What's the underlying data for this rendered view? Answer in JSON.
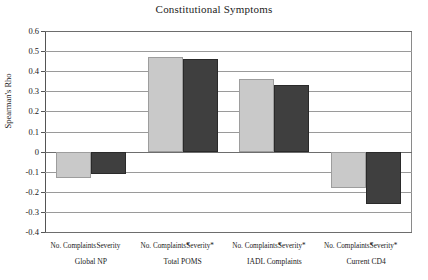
{
  "chart_data": {
    "type": "bar",
    "title": "Constitutional Symptoms",
    "xlabel": "",
    "ylabel": "Spearman's Rho",
    "ylim": [
      -0.4,
      0.6
    ],
    "yticks": [
      0.6,
      0.5,
      0.4,
      0.3,
      0.2,
      0.1,
      0,
      -0.1,
      -0.2,
      -0.3,
      -0.4
    ],
    "ytick_labels": [
      "0.6",
      "0.5",
      "0.4",
      "0.3",
      "0.2",
      "0.1",
      "0",
      "-0.1",
      "-0.2",
      "-0.3",
      "-0.4"
    ],
    "grid": true,
    "legend": "none",
    "groups": [
      {
        "name": "Global NP",
        "bars": [
          {
            "label": "No. Complaints",
            "value": -0.13,
            "style": "light"
          },
          {
            "label": "Severity",
            "value": -0.11,
            "style": "dark"
          }
        ]
      },
      {
        "name": "Total POMS",
        "bars": [
          {
            "label": "No. Complaints*",
            "value": 0.47,
            "style": "light"
          },
          {
            "label": "Severity*",
            "value": 0.46,
            "style": "dark"
          }
        ]
      },
      {
        "name": "IADL Complaints",
        "bars": [
          {
            "label": "No. Complaints*",
            "value": 0.36,
            "style": "light"
          },
          {
            "label": "Severity*",
            "value": 0.33,
            "style": "dark"
          }
        ]
      },
      {
        "name": "Current CD4",
        "bars": [
          {
            "label": "No. Complaints*",
            "value": -0.18,
            "style": "light"
          },
          {
            "label": "Severity*",
            "value": -0.26,
            "style": "dark"
          }
        ]
      }
    ],
    "colors": {
      "light_bar": "#c9c9c9",
      "dark_bar": "#3f3f3f",
      "gridline": "#9a9a9a",
      "axis": "#555555",
      "text": "#1a1a1a",
      "background": "#ffffff"
    }
  }
}
